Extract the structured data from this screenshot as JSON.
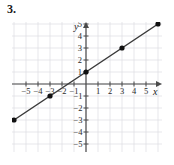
{
  "problem": {
    "number_label": "3."
  },
  "chart_data": {
    "type": "line",
    "title": "",
    "xlabel": "x",
    "ylabel": "y",
    "equation": "y = (2/3)x + 1",
    "slope": 0.6666666667,
    "intercept": 1,
    "x": [
      -6,
      -3,
      0,
      3,
      6
    ],
    "values": [
      -3,
      -1,
      1,
      3,
      5
    ],
    "points": [
      {
        "x": -6,
        "y": -3
      },
      {
        "x": -3,
        "y": -1
      },
      {
        "x": 0,
        "y": 1
      },
      {
        "x": 3,
        "y": 3
      },
      {
        "x": 6,
        "y": 5
      }
    ],
    "xlim": [
      -6.4,
      6.4
    ],
    "ylim": [
      -5.6,
      5.6
    ],
    "xticks": [
      -5,
      -4,
      -3,
      -2,
      -1,
      1,
      2,
      3,
      4,
      5
    ],
    "yticks": [
      5,
      4,
      3,
      2,
      1,
      -1,
      -2,
      -3,
      -4,
      -5
    ],
    "xtick_labels": [
      "-5",
      "-4",
      "-3",
      "-2",
      "-1",
      "1",
      "2",
      "3",
      "4",
      "5"
    ],
    "ytick_labels": [
      "5",
      "4",
      "3",
      "2",
      "1",
      "-1",
      "-2",
      "-3",
      "-4",
      "-5"
    ],
    "grid": true,
    "legend": "none",
    "line_color": "#3a3a3a",
    "point_color": "#111111",
    "grid_color": "#dcdde2",
    "axis_color": "#4a4a4a",
    "background": "#ffffff"
  }
}
